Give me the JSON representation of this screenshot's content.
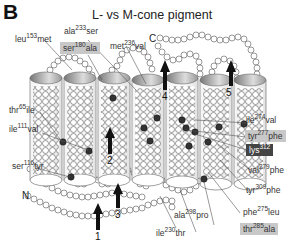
{
  "figure": {
    "panel_letter": "B",
    "title": "L- vs M-cone pigment",
    "termini": {
      "n": "N",
      "c": "C"
    },
    "helix_numbers": [
      "1",
      "2",
      "3",
      "4",
      "5"
    ],
    "labels": [
      {
        "id": "leu153met",
        "from": "leu",
        "pos": "153",
        "to": "met",
        "highlight": "none"
      },
      {
        "id": "ala233ser",
        "from": "ala",
        "pos": "233",
        "to": "ser",
        "highlight": "none"
      },
      {
        "id": "ser180ala",
        "from": "ser",
        "pos": "180",
        "to": "ala",
        "highlight": "light"
      },
      {
        "id": "met236val",
        "from": "met",
        "pos": "236",
        "to": "val",
        "highlight": "none"
      },
      {
        "id": "thr65ile",
        "from": "thr",
        "pos": "65",
        "to": "ile",
        "highlight": "none"
      },
      {
        "id": "ile111val",
        "from": "ile",
        "pos": "111",
        "to": "val",
        "highlight": "none"
      },
      {
        "id": "ser116tyr",
        "from": "ser",
        "pos": "116",
        "to": "tyr",
        "highlight": "none"
      },
      {
        "id": "ile274val",
        "from": "ile",
        "pos": "274",
        "to": "val",
        "highlight": "none"
      },
      {
        "id": "tyr277phe",
        "from": "tyr",
        "pos": "277",
        "to": "phe",
        "highlight": "light"
      },
      {
        "id": "lys312",
        "from": "lys",
        "pos": "312",
        "to": "",
        "highlight": "dark"
      },
      {
        "id": "val279phe",
        "from": "val",
        "pos": "279",
        "to": "phe",
        "highlight": "none"
      },
      {
        "id": "tyr309phe",
        "from": "tyr",
        "pos": "309",
        "to": "phe",
        "highlight": "none"
      },
      {
        "id": "phe275leu",
        "from": "phe",
        "pos": "275",
        "to": "leu",
        "highlight": "none"
      },
      {
        "id": "ala298pro",
        "from": "ala",
        "pos": "298",
        "to": "pro",
        "highlight": "none"
      },
      {
        "id": "ile230thr",
        "from": "ile",
        "pos": "230",
        "to": "thr",
        "highlight": "none"
      },
      {
        "id": "thr285ala",
        "from": "thr",
        "pos": "285",
        "to": "ala",
        "highlight": "light"
      }
    ]
  }
}
